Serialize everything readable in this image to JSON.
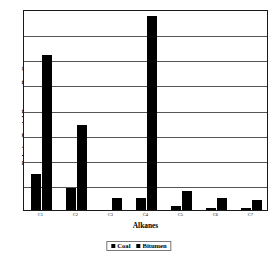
{
  "chart_data": {
    "type": "bar",
    "title": "",
    "xlabel": "Alkanes",
    "ylabel": "Relative Partial Pressure Per Gram",
    "categories": [
      "C1",
      "C2",
      "C3",
      "C4",
      "C5",
      "C6",
      "C7"
    ],
    "series": [
      {
        "name": "Coal",
        "color": "#000000",
        "values": [
          1.5,
          0.9,
          0.0,
          0.5,
          0.15,
          0.1,
          0.08
        ]
      },
      {
        "name": "Bitumen",
        "color": "#000000",
        "values": [
          6.4,
          3.5,
          0.5,
          8.0,
          0.8,
          0.5,
          0.4
        ]
      }
    ],
    "ylim": [
      0,
      8.3
    ],
    "yticks": [
      0,
      1,
      2,
      3,
      4,
      5,
      6,
      7,
      8
    ],
    "ytick_labels": [
      "",
      "",
      "",
      "",
      "",
      "",
      "",
      "",
      ""
    ],
    "grid": true,
    "grid_lines": 7,
    "legend_position": "bottom-center",
    "axis_color": "#1a1a1a",
    "grid_color": "#555555",
    "background": "#ffffff"
  },
  "legend": {
    "entries": [
      {
        "label": "Coal"
      },
      {
        "label": "Bitumen"
      }
    ]
  }
}
